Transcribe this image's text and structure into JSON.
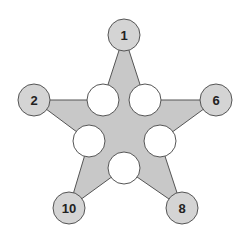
{
  "diagram": {
    "type": "magic-star-puzzle",
    "colors": {
      "star_fill": "#c8c8c8",
      "stroke": "#555555",
      "tip_fill": "#d4d4d4",
      "inner_fill": "#ffffff"
    },
    "tips": [
      {
        "id": "top",
        "label": "1"
      },
      {
        "id": "left",
        "label": "2"
      },
      {
        "id": "right",
        "label": "6"
      },
      {
        "id": "bottom-left",
        "label": "10"
      },
      {
        "id": "bottom-right",
        "label": "8"
      }
    ],
    "inner": [
      {
        "id": "upper-left",
        "label": ""
      },
      {
        "id": "upper-right",
        "label": ""
      },
      {
        "id": "middle-left",
        "label": ""
      },
      {
        "id": "middle-right",
        "label": ""
      },
      {
        "id": "bottom",
        "label": ""
      }
    ]
  }
}
